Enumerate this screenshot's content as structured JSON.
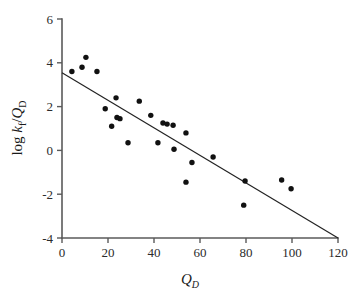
{
  "figure": {
    "background": "#ffffff",
    "point_color": "#111111",
    "line_color": "#222222",
    "axis_color": "#5a5a5a"
  },
  "axes": {
    "x_title_main": "Q",
    "x_title_sub": "D",
    "y_title_prefix": "log ",
    "y_title_k": "k",
    "y_title_k_sub": "f",
    "y_title_slash": "/",
    "y_title_q": "Q",
    "y_title_q_sub": "D",
    "x_ticks": [
      "0",
      "20",
      "40",
      "60",
      "80",
      "100",
      "120"
    ],
    "y_ticks": [
      "6",
      "4",
      "2",
      "0",
      "-2",
      "-4"
    ]
  },
  "chart_data": {
    "type": "scatter",
    "title": "",
    "subtitle": "",
    "xlabel": "Q_D",
    "ylabel": "log k_f/Q_D",
    "xlim": [
      0,
      120
    ],
    "ylim": [
      -4,
      6
    ],
    "xticks": [
      0,
      20,
      40,
      60,
      80,
      100,
      120
    ],
    "yticks": [
      -4,
      -2,
      0,
      2,
      4,
      6
    ],
    "grid": false,
    "legend": null,
    "annotations": [],
    "series": [
      {
        "name": "data points",
        "marker": "filled-circle",
        "color": "#111111",
        "points": [
          [
            4.3,
            3.6
          ],
          [
            8.7,
            3.8
          ],
          [
            10.4,
            4.25
          ],
          [
            15.2,
            3.6
          ],
          [
            18.8,
            1.9
          ],
          [
            21.6,
            1.1
          ],
          [
            23.5,
            2.4
          ],
          [
            23.9,
            1.5
          ],
          [
            25.2,
            1.45
          ],
          [
            28.7,
            0.35
          ],
          [
            33.6,
            2.25
          ],
          [
            38.6,
            1.6
          ],
          [
            41.7,
            0.35
          ],
          [
            43.9,
            1.25
          ],
          [
            45.7,
            1.2
          ],
          [
            48.3,
            1.15
          ],
          [
            48.7,
            0.05
          ],
          [
            53.9,
            0.8
          ],
          [
            53.9,
            -1.45
          ],
          [
            56.5,
            -0.55
          ],
          [
            65.7,
            -0.3
          ],
          [
            79.0,
            -2.5
          ],
          [
            79.6,
            -1.4
          ],
          [
            95.5,
            -1.35
          ],
          [
            99.6,
            -1.75
          ]
        ]
      }
    ],
    "fit_line": {
      "name": "regression line",
      "color": "#222222",
      "x": [
        0,
        120
      ],
      "y": [
        3.55,
        -4.0
      ],
      "slope": -0.0629,
      "intercept": 3.55
    }
  }
}
